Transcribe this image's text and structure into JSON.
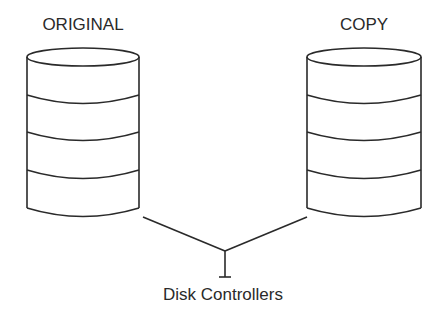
{
  "diagram": {
    "disks": [
      {
        "id": "original",
        "label": "ORIGINAL",
        "segments": 4
      },
      {
        "id": "copy",
        "label": "COPY",
        "segments": 4
      }
    ],
    "controller": {
      "label": "Disk Controllers"
    },
    "colors": {
      "stroke": "#2a2a2a",
      "background": "#ffffff"
    }
  }
}
